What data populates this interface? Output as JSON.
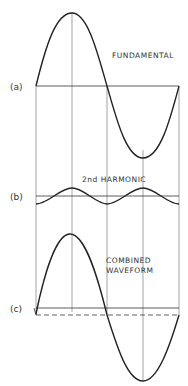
{
  "diagram": {
    "panels": [
      {
        "tag": "(a)",
        "title": "FUNDAMENTAL"
      },
      {
        "tag": "(b)",
        "title": "2nd HARMONIC"
      },
      {
        "tag": "(c)",
        "title_line1": "COMBINED",
        "title_line2": "WAVEFORM"
      }
    ],
    "colors": {
      "stroke": "#222222",
      "guide": "#555555",
      "background": "#ffffff"
    }
  }
}
